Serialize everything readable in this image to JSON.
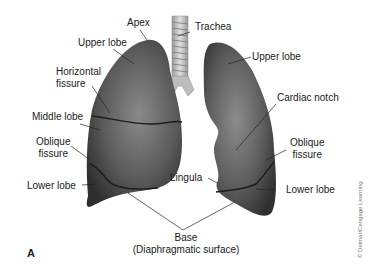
{
  "figure": {
    "panel_label": "A",
    "copyright": "© Delmar/Cengage Learning",
    "labels": {
      "apex": "Apex",
      "trachea": "Trachea",
      "upper_lobe_right": "Upper lobe",
      "upper_lobe_left": "Upper lobe",
      "horizontal_fissure_line1": "Horizontal",
      "horizontal_fissure_line2": "fissure",
      "middle_lobe": "Middle lobe",
      "cardiac_notch": "Cardiac notch",
      "oblique_fissure_right_line1": "Oblique",
      "oblique_fissure_right_line2": "fissure",
      "oblique_fissure_left_line1": "Oblique",
      "oblique_fissure_left_line2": "fissure",
      "lower_lobe_right": "Lower lobe",
      "lower_lobe_left": "Lower lobe",
      "lingula": "Lingula",
      "base_line1": "Base",
      "base_line2": "(Diaphragmatic surface)"
    },
    "colors": {
      "lung_dark": "#3a3a3a",
      "lung_mid": "#6e6e6e",
      "lung_light": "#9a9a9a",
      "trachea": "#c8c8c8",
      "leader_line": "#222222"
    }
  }
}
